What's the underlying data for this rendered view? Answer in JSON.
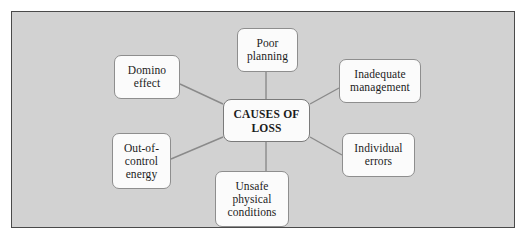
{
  "diagram": {
    "type": "radial-mind-map",
    "title_node": "CAUSES OF\nLOSS",
    "panel_background": "#d2d2d2",
    "node_fill": "#fbfbfb",
    "node_border": "#8e8e8e",
    "edge_color": "#8a8a8a",
    "center": {
      "label": "CAUSES OF\nLOSS",
      "x": 211,
      "y": 87,
      "w": 87,
      "h": 43
    },
    "nodes": [
      {
        "id": "poor-planning",
        "label": "Poor\nplanning",
        "x": 225,
        "y": 16,
        "w": 61,
        "h": 44
      },
      {
        "id": "domino-effect",
        "label": "Domino\neffect",
        "x": 102,
        "y": 43,
        "w": 66,
        "h": 44
      },
      {
        "id": "inadequate-management",
        "label": "Inadequate\nmanagement",
        "x": 327,
        "y": 47,
        "w": 82,
        "h": 44
      },
      {
        "id": "out-of-control-energy",
        "label": "Out-of-\ncontrol\nenergy",
        "x": 100,
        "y": 121,
        "w": 59,
        "h": 56
      },
      {
        "id": "individual-errors",
        "label": "Individual\nerrors",
        "x": 330,
        "y": 121,
        "w": 73,
        "h": 44
      },
      {
        "id": "unsafe-physical-conditions",
        "label": "Unsafe\nphysical\nconditions",
        "x": 203,
        "y": 159,
        "w": 74,
        "h": 56
      }
    ],
    "edges": [
      {
        "from": "center",
        "to": "poor-planning",
        "x1": 254,
        "y1": 87,
        "x2": 254,
        "y2": 60
      },
      {
        "from": "center",
        "to": "domino-effect",
        "x1": 211,
        "y1": 92,
        "x2": 168,
        "y2": 72
      },
      {
        "from": "center",
        "to": "inadequate-management",
        "x1": 298,
        "y1": 92,
        "x2": 327,
        "y2": 76
      },
      {
        "from": "center",
        "to": "out-of-control-energy",
        "x1": 211,
        "y1": 125,
        "x2": 159,
        "y2": 147
      },
      {
        "from": "center",
        "to": "individual-errors",
        "x1": 298,
        "y1": 125,
        "x2": 330,
        "y2": 143
      },
      {
        "from": "center",
        "to": "unsafe-physical-conditions",
        "x1": 254,
        "y1": 130,
        "x2": 254,
        "y2": 159
      }
    ]
  }
}
